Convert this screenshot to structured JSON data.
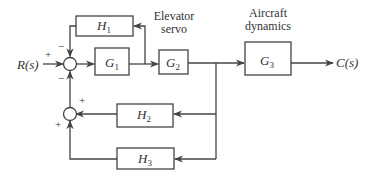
{
  "diagram": {
    "type": "block_diagram",
    "input": {
      "label": "R(s)"
    },
    "output": {
      "label": "C(s)"
    },
    "blocks": [
      {
        "id": "G1",
        "label": "G",
        "sub": "1"
      },
      {
        "id": "G2",
        "label": "G",
        "sub": "2",
        "caption": [
          "Elevator",
          "servo"
        ]
      },
      {
        "id": "G3",
        "label": "G",
        "sub": "3",
        "caption": [
          "Aircraft",
          "dynamics"
        ]
      },
      {
        "id": "H1",
        "label": "H",
        "sub": "1"
      },
      {
        "id": "H2",
        "label": "H",
        "sub": "2"
      },
      {
        "id": "H3",
        "label": "H",
        "sub": "3"
      }
    ],
    "summing_junctions": [
      {
        "id": "S1",
        "signs": {
          "input": "+",
          "top": "−",
          "bottom": "−"
        }
      },
      {
        "id": "S2",
        "signs": {
          "right": "+",
          "bottom": "+"
        }
      }
    ],
    "connections": [
      "R(s) → S1 (+)",
      "S1 → G1",
      "G1 → G2",
      "G1 output → H1 → S1 (−)",
      "G2 → G3",
      "G3 → C(s)",
      "G2 output → H2 → S2 (+)",
      "G2 output → H3 → S2 (+)",
      "S2 → S1 (−)"
    ]
  }
}
